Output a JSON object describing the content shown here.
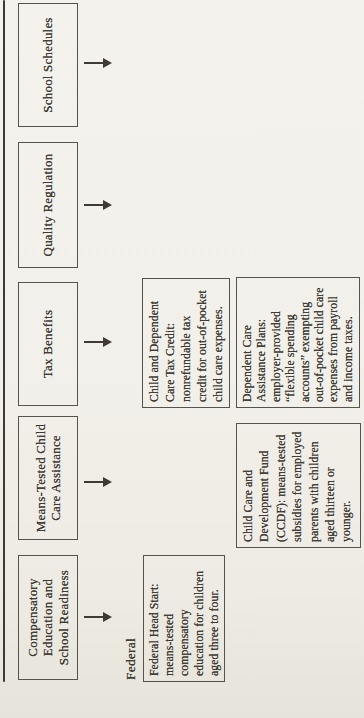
{
  "colors": {
    "paper": "#f2f0ea",
    "paper_edge": "#e6e3da",
    "ink": "#3f3b34",
    "box_border": "#57524b"
  },
  "figure": {
    "section_label": "Federal",
    "headers": [
      {
        "id": "compensatory",
        "lines": [
          "Compensatory",
          "Education and",
          "School Readiness"
        ]
      },
      {
        "id": "means-tested",
        "lines": [
          "Means-Tested Child",
          "Care Assistance"
        ]
      },
      {
        "id": "tax-benefits",
        "lines": [
          "Tax Benefits"
        ]
      },
      {
        "id": "quality-regulation",
        "lines": [
          "Quality Regulation"
        ]
      },
      {
        "id": "school-schedules",
        "lines": [
          "School Schedules"
        ]
      }
    ],
    "details": [
      {
        "id": "head-start",
        "lines": [
          "Federal Head Start:",
          "means-tested",
          "compensatory",
          "education for children",
          "aged three to four."
        ]
      },
      {
        "id": "ccdf",
        "lines": [
          "Child Care and",
          "Development Fund",
          "(CCDF): means-tested",
          "subsidies for employed",
          "parents with children",
          "aged thirteen or",
          "younger."
        ]
      },
      {
        "id": "tax-credit",
        "lines": [
          "Child and Dependent",
          "Care Tax Credit:",
          "nonrefundable tax",
          "credit for out-of-pocket",
          "child care expenses."
        ]
      },
      {
        "id": "dcap",
        "lines": [
          "Dependent Care",
          "Assistance Plans:",
          "employer-provided",
          "“flexible spending",
          "accounts” exempting",
          "out-of-pocket child care",
          "expenses from payroll",
          "and income taxes."
        ]
      }
    ]
  }
}
